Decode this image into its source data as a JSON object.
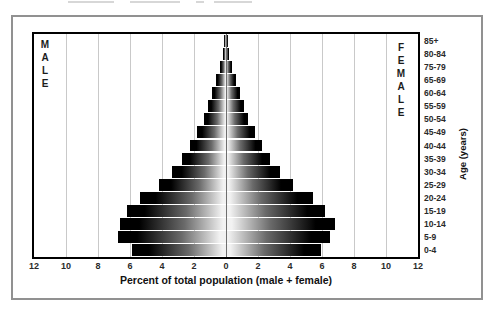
{
  "top_cropped_text_visible": true,
  "chart_data": {
    "type": "bar",
    "subtype": "population-pyramid",
    "title": "",
    "xlabel": "Percent of total population (male + female)",
    "age_axis_label": "Age (years)",
    "left_side_label": "MALE",
    "right_side_label": "FEMALE",
    "x_axis_range_per_side": 12,
    "x_ticks": [
      "12",
      "10",
      "8",
      "6",
      "4",
      "2",
      "0",
      "2",
      "4",
      "6",
      "8",
      "10",
      "12"
    ],
    "grid": "vertical gridlines every 2 percent, light gray; darker line at 0",
    "legend_position": "none",
    "age_groups_top_to_bottom": [
      "85+",
      "80-84",
      "75-79",
      "65-69",
      "60-64",
      "55-59",
      "50-54",
      "45-49",
      "40-44",
      "35-39",
      "30-34",
      "25-29",
      "20-24",
      "15-19",
      "10-14",
      "5-9",
      "0-4"
    ],
    "series": [
      {
        "name": "Male",
        "side": "left",
        "values_percent": [
          0.1,
          0.2,
          0.35,
          0.6,
          0.85,
          1.1,
          1.4,
          1.8,
          2.25,
          2.75,
          3.35,
          4.2,
          5.4,
          6.2,
          6.6,
          6.75,
          5.9
        ]
      },
      {
        "name": "Female",
        "side": "right",
        "values_percent": [
          0.1,
          0.2,
          0.35,
          0.6,
          0.85,
          1.1,
          1.4,
          1.8,
          2.25,
          2.75,
          3.35,
          4.2,
          5.45,
          6.2,
          6.8,
          6.5,
          5.95
        ]
      }
    ],
    "bar_style_colors": {
      "edge": "#000000",
      "center": "#f2f2f2"
    },
    "gridline_color": "#c9c9c9",
    "plot_border_color": "#000000",
    "figure_border_color": "#919191"
  }
}
